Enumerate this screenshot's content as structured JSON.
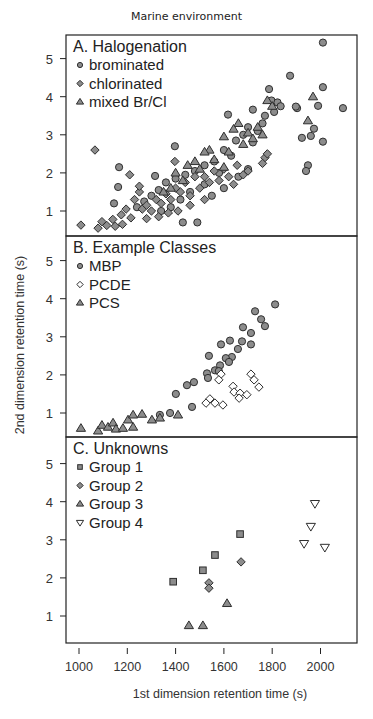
{
  "figure": {
    "title": "Marine environment",
    "xlabel": "1st dimension retention time (s)",
    "ylabel": "2nd dimension retention time (s)"
  },
  "colors": {
    "marker_fill": "#8c8c8c",
    "marker_edge": "#2e2e2e",
    "open_fill": "#ffffff",
    "axis": "#222222"
  },
  "chart_data": [
    {
      "type": "scatter",
      "panel": "A",
      "title": "A. Halogenation",
      "xlabel": "1st dimension retention time (s)",
      "ylabel": "2nd dimension retention time (s)",
      "xlim": [
        960,
        2140
      ],
      "ylim": [
        0.4,
        5.65
      ],
      "xticks": [
        1000,
        1200,
        1400,
        1600,
        1800,
        2000
      ],
      "yticks": [
        1,
        2,
        3,
        4,
        5
      ],
      "grid": false,
      "legend_position": "upper left",
      "series": [
        {
          "name": "brominated",
          "marker": "circle",
          "points": [
            [
              2010,
              5.42
            ],
            [
              1874,
              4.55
            ],
            [
              2010,
              4.25
            ],
            [
              1787,
              4.2
            ],
            [
              1903,
              3.7
            ],
            [
              1990,
              3.76
            ],
            [
              2093,
              3.7
            ],
            [
              1898,
              3.74
            ],
            [
              1617,
              3.53
            ],
            [
              1720,
              3.66
            ],
            [
              1797,
              3.9
            ],
            [
              1822,
              3.85
            ],
            [
              1835,
              3.75
            ],
            [
              1808,
              3.6
            ],
            [
              1770,
              3.5
            ],
            [
              1760,
              3.3
            ],
            [
              1973,
              3.16
            ],
            [
              1960,
              2.97
            ],
            [
              1923,
              2.92
            ],
            [
              2010,
              2.82
            ],
            [
              1948,
              2.2
            ],
            [
              1940,
              2.05
            ],
            [
              1397,
              2.7
            ],
            [
              1166,
              2.15
            ],
            [
              1162,
              1.63
            ],
            [
              1145,
              1.2
            ],
            [
              1315,
              1.92
            ],
            [
              1700,
              3.2
            ],
            [
              1740,
              3.1
            ],
            [
              1680,
              3.0
            ],
            [
              1650,
              2.85
            ],
            [
              1720,
              2.8
            ],
            [
              1600,
              2.6
            ],
            [
              1630,
              2.45
            ],
            [
              1560,
              2.3
            ],
            [
              1520,
              2.2
            ],
            [
              1480,
              2.05
            ],
            [
              1440,
              1.95
            ],
            [
              1400,
              1.85
            ],
            [
              1360,
              1.75
            ],
            [
              1330,
              1.55
            ],
            [
              1300,
              1.4
            ],
            [
              1270,
              1.25
            ],
            [
              1240,
              1.1
            ],
            [
              1430,
              0.7
            ],
            [
              1490,
              0.7
            ],
            [
              1550,
              1.4
            ],
            [
              1600,
              1.6
            ],
            [
              1660,
              1.9
            ],
            [
              1700,
              2.1
            ],
            [
              1580,
              2.0
            ],
            [
              1520,
              1.7
            ],
            [
              1460,
              1.5
            ],
            [
              1420,
              1.3
            ],
            [
              1380,
              1.1
            ],
            [
              1340,
              1.0
            ]
          ]
        },
        {
          "name": "chlorinated",
          "marker": "diamond",
          "points": [
            [
              1066,
              2.6
            ],
            [
              1008,
              0.63
            ],
            [
              1079,
              0.55
            ],
            [
              1095,
              0.72
            ],
            [
              1115,
              0.62
            ],
            [
              1140,
              0.78
            ],
            [
              1150,
              0.6
            ],
            [
              1175,
              0.9
            ],
            [
              1180,
              0.65
            ],
            [
              1195,
              1.05
            ],
            [
              1215,
              0.82
            ],
            [
              1230,
              1.3
            ],
            [
              1250,
              1.5
            ],
            [
              1262,
              1.05
            ],
            [
              1280,
              1.15
            ],
            [
              1300,
              1.0
            ],
            [
              1320,
              1.3
            ],
            [
              1340,
              1.2
            ],
            [
              1360,
              1.45
            ],
            [
              1380,
              1.3
            ],
            [
              1400,
              1.6
            ],
            [
              1420,
              1.5
            ],
            [
              1440,
              1.75
            ],
            [
              1460,
              1.4
            ],
            [
              1480,
              1.9
            ],
            [
              1500,
              1.6
            ],
            [
              1520,
              1.9
            ],
            [
              1540,
              1.75
            ],
            [
              1560,
              2.05
            ],
            [
              1580,
              1.8
            ],
            [
              1600,
              2.1
            ],
            [
              1620,
              1.9
            ],
            [
              1640,
              1.7
            ],
            [
              1655,
              2.2
            ],
            [
              1680,
              1.95
            ],
            [
              1700,
              2.05
            ],
            [
              1770,
              2.4
            ],
            [
              1780,
              2.5
            ],
            [
              1760,
              2.25
            ],
            [
              1397,
              2.3
            ],
            [
              1210,
              1.95
            ],
            [
              1250,
              1.65
            ],
            [
              1280,
              0.8
            ],
            [
              1330,
              0.85
            ],
            [
              1370,
              0.95
            ],
            [
              1410,
              1.0
            ],
            [
              1460,
              1.15
            ],
            [
              1520,
              1.3
            ]
          ]
        },
        {
          "name": "mixed Br/Cl",
          "marker": "triangle",
          "points": [
            [
              1969,
              4.0
            ],
            [
              1948,
              3.37
            ],
            [
              1780,
              3.9
            ],
            [
              1800,
              3.75
            ],
            [
              1660,
              3.3
            ],
            [
              1640,
              3.15
            ],
            [
              1700,
              3.05
            ],
            [
              1720,
              2.9
            ],
            [
              1600,
              2.95
            ],
            [
              1540,
              2.6
            ],
            [
              1520,
              2.55
            ],
            [
              1480,
              2.3
            ],
            [
              1450,
              2.2
            ],
            [
              1400,
              2.0
            ],
            [
              1560,
              2.35
            ],
            [
              1620,
              2.55
            ],
            [
              1680,
              2.75
            ],
            [
              1740,
              3.2
            ],
            [
              1760,
              3.0
            ],
            [
              1600,
              2.15
            ],
            [
              1500,
              2.1
            ],
            [
              1430,
              1.8
            ],
            [
              1380,
              1.6
            ],
            [
              1350,
              1.5
            ]
          ]
        }
      ]
    },
    {
      "type": "scatter",
      "panel": "B",
      "title": "B. Example Classes",
      "xlim": [
        960,
        2140
      ],
      "ylim": [
        0.4,
        5.65
      ],
      "xticks": [
        1000,
        1200,
        1400,
        1600,
        1800,
        2000
      ],
      "yticks": [
        1,
        2,
        3,
        4,
        5
      ],
      "grid": false,
      "legend_position": "upper left",
      "series": [
        {
          "name": "MBP",
          "marker": "circle",
          "points": [
            [
              1812,
              3.85
            ],
            [
              1729,
              3.67
            ],
            [
              1754,
              3.46
            ],
            [
              1770,
              3.28
            ],
            [
              1679,
              3.25
            ],
            [
              1712,
              3.1
            ],
            [
              1625,
              2.9
            ],
            [
              1588,
              2.8
            ],
            [
              1675,
              2.88
            ],
            [
              1712,
              2.8
            ],
            [
              1658,
              2.68
            ],
            [
              1538,
              2.5
            ],
            [
              1633,
              2.47
            ],
            [
              1608,
              2.44
            ],
            [
              1621,
              2.34
            ],
            [
              1584,
              2.25
            ],
            [
              1563,
              2.12
            ],
            [
              1530,
              2.04
            ],
            [
              1579,
              2.1
            ],
            [
              1534,
              1.92
            ],
            [
              1476,
              1.81
            ],
            [
              1447,
              1.73
            ],
            [
              1401,
              1.5
            ],
            [
              1468,
              1.16
            ],
            [
              1377,
              1.0
            ],
            [
              1335,
              0.95
            ]
          ]
        },
        {
          "name": "PCDE",
          "marker": "diamond-open",
          "points": [
            [
              1588,
              2.02
            ],
            [
              1579,
              1.87
            ],
            [
              1712,
              2.02
            ],
            [
              1725,
              1.87
            ],
            [
              1745,
              1.68
            ],
            [
              1638,
              1.7
            ],
            [
              1642,
              1.55
            ],
            [
              1667,
              1.52
            ],
            [
              1695,
              1.48
            ],
            [
              1663,
              1.39
            ],
            [
              1542,
              1.37
            ],
            [
              1526,
              1.26
            ],
            [
              1563,
              1.26
            ],
            [
              1596,
              1.21
            ]
          ]
        },
        {
          "name": "PCS",
          "marker": "triangle",
          "points": [
            [
              1008,
              0.6
            ],
            [
              1079,
              0.53
            ],
            [
              1095,
              0.68
            ],
            [
              1120,
              0.63
            ],
            [
              1141,
              0.74
            ],
            [
              1153,
              0.58
            ],
            [
              1182,
              0.6
            ],
            [
              1203,
              0.82
            ],
            [
              1224,
              0.95
            ],
            [
              1224,
              0.63
            ],
            [
              1261,
              0.97
            ],
            [
              1302,
              0.82
            ],
            [
              1335,
              0.87
            ],
            [
              1410,
              0.95
            ]
          ]
        }
      ]
    },
    {
      "type": "scatter",
      "panel": "C",
      "title": "C. Unknowns",
      "xlim": [
        960,
        2140
      ],
      "ylim": [
        0.4,
        5.65
      ],
      "xticks": [
        1000,
        1200,
        1400,
        1600,
        1800,
        2000
      ],
      "yticks": [
        1,
        2,
        3,
        4,
        5
      ],
      "grid": false,
      "legend_position": "upper left",
      "series": [
        {
          "name": "Group 1",
          "marker": "square",
          "points": [
            [
              1390,
              1.9
            ],
            [
              1513,
              2.2
            ],
            [
              1563,
              2.6
            ],
            [
              1667,
              3.15
            ]
          ]
        },
        {
          "name": "Group 2",
          "marker": "diamond",
          "points": [
            [
              1538,
              1.87
            ],
            [
              1538,
              1.73
            ],
            [
              1671,
              2.42
            ]
          ]
        },
        {
          "name": "Group 3",
          "marker": "triangle",
          "points": [
            [
              1455,
              0.75
            ],
            [
              1513,
              0.75
            ],
            [
              1613,
              1.33
            ]
          ]
        },
        {
          "name": "Group 4",
          "marker": "triangle-down-open",
          "points": [
            [
              1977,
              3.95
            ],
            [
              1960,
              3.35
            ],
            [
              1932,
              2.9
            ],
            [
              2018,
              2.8
            ]
          ]
        }
      ]
    }
  ]
}
